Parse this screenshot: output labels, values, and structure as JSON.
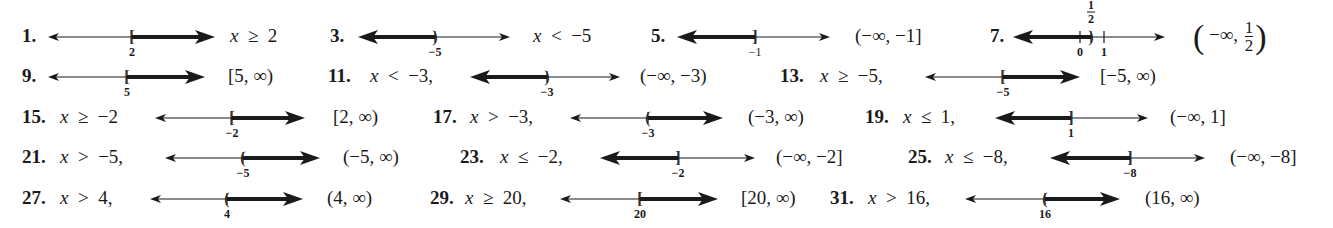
{
  "header": {
    "cutoff_text": ""
  },
  "problems": [
    {
      "id": "1",
      "label": "1.",
      "row": 0,
      "label_x": 22,
      "inequality": "x ≥ 2",
      "ineq_x": 230,
      "interval": "",
      "interval_x": 0,
      "line": {
        "x1": 48,
        "x2": 215,
        "point_x": 132,
        "point_label": "2",
        "bracket": "[",
        "shade": "right",
        "label_bold": true
      }
    },
    {
      "id": "3",
      "label": "3.",
      "row": 0,
      "label_x": 330,
      "inequality": "x < −5",
      "ineq_x": 533,
      "interval": "",
      "interval_x": 0,
      "line": {
        "x1": 358,
        "x2": 510,
        "point_x": 435,
        "point_label": "−5",
        "bracket": ")",
        "shade": "left",
        "label_bold": true
      }
    },
    {
      "id": "5",
      "label": "5.",
      "row": 0,
      "label_x": 651,
      "inequality": "",
      "ineq_x": 0,
      "interval": "(−∞, −1]",
      "interval_x": 855,
      "line": {
        "x1": 677,
        "x2": 830,
        "point_x": 755,
        "point_label": "−1",
        "bracket": "]",
        "shade": "left",
        "label_bold": false
      }
    },
    {
      "id": "7",
      "label": "7.",
      "row": 0,
      "label_x": 990,
      "inequality": "",
      "ineq_x": 0,
      "interval": "(−∞, 1/2)",
      "interval_x": 1193,
      "interval_parts": {
        "open": "(",
        "prefix": "−∞,",
        "num": "1",
        "den": "2",
        "close": ")"
      },
      "line": {
        "x1": 1013,
        "x2": 1165,
        "point_x": 1091,
        "point_label": "1/2",
        "bracket": ")",
        "shade": "left",
        "label_bold": true,
        "extra_ticks": [
          {
            "x": 1080,
            "label": "0"
          },
          {
            "x": 1104,
            "label": "1"
          }
        ]
      }
    },
    {
      "id": "9",
      "label": "9.",
      "row": 1,
      "label_x": 22,
      "inequality": "",
      "ineq_x": 0,
      "interval": "[5, ∞)",
      "interval_x": 228,
      "line": {
        "x1": 48,
        "x2": 205,
        "point_x": 127,
        "point_label": "5",
        "bracket": "[",
        "shade": "right",
        "label_bold": true
      }
    },
    {
      "id": "11",
      "label": "11.",
      "row": 1,
      "label_x": 328,
      "inequality": "x < −3,",
      "ineq_x": 370,
      "interval": "(−∞, −3)",
      "interval_x": 640,
      "line": {
        "x1": 470,
        "x2": 620,
        "point_x": 547,
        "point_label": "−3",
        "bracket": ")",
        "shade": "left",
        "label_bold": true
      }
    },
    {
      "id": "13",
      "label": "13.",
      "row": 1,
      "label_x": 780,
      "inequality": "x ≥ −5,",
      "ineq_x": 820,
      "interval": "[−5, ∞)",
      "interval_x": 1100,
      "line": {
        "x1": 925,
        "x2": 1080,
        "point_x": 1003,
        "point_label": "−5",
        "bracket": "[",
        "shade": "right",
        "label_bold": true
      }
    },
    {
      "id": "15",
      "label": "15.",
      "row": 2,
      "label_x": 22,
      "inequality": "x ≥ −2",
      "ineq_x": 60,
      "interval": "[2, ∞)",
      "interval_x": 333,
      "line": {
        "x1": 155,
        "x2": 305,
        "point_x": 232,
        "point_label": "−2",
        "bracket": "[",
        "shade": "right",
        "label_bold": true
      }
    },
    {
      "id": "17",
      "label": "17.",
      "row": 2,
      "label_x": 433,
      "inequality": "x > −3,",
      "ineq_x": 470,
      "interval": "(−3, ∞)",
      "interval_x": 748,
      "line": {
        "x1": 570,
        "x2": 723,
        "point_x": 648,
        "point_label": "−3",
        "bracket": "(",
        "shade": "right",
        "label_bold": true
      }
    },
    {
      "id": "19",
      "label": "19.",
      "row": 2,
      "label_x": 865,
      "inequality": "x ≤ 1,",
      "ineq_x": 903,
      "interval": "(−∞, 1]",
      "interval_x": 1170,
      "line": {
        "x1": 995,
        "x2": 1148,
        "point_x": 1071,
        "point_label": "1",
        "bracket": "]",
        "shade": "left",
        "label_bold": true
      }
    },
    {
      "id": "21",
      "label": "21.",
      "row": 3,
      "label_x": 22,
      "inequality": "x > −5,",
      "ineq_x": 60,
      "interval": "(−5, ∞)",
      "interval_x": 343,
      "line": {
        "x1": 165,
        "x2": 320,
        "point_x": 243,
        "point_label": "−5",
        "bracket": "(",
        "shade": "right",
        "label_bold": true
      }
    },
    {
      "id": "23",
      "label": "23.",
      "row": 3,
      "label_x": 460,
      "inequality": "x ≤ −2,",
      "ineq_x": 500,
      "interval": "(−∞, −2]",
      "interval_x": 776,
      "line": {
        "x1": 600,
        "x2": 755,
        "point_x": 678,
        "point_label": "−2",
        "bracket": "]",
        "shade": "left",
        "label_bold": true
      }
    },
    {
      "id": "25",
      "label": "25.",
      "row": 3,
      "label_x": 908,
      "inequality": "x ≤ −8,",
      "ineq_x": 945,
      "interval": "(−∞, −8]",
      "interval_x": 1230,
      "line": {
        "x1": 1050,
        "x2": 1205,
        "point_x": 1130,
        "point_label": "−8",
        "bracket": "]",
        "shade": "left",
        "label_bold": true
      }
    },
    {
      "id": "27",
      "label": "27.",
      "row": 4,
      "label_x": 22,
      "inequality": "x > 4,",
      "ineq_x": 60,
      "interval": "(4, ∞)",
      "interval_x": 327,
      "line": {
        "x1": 150,
        "x2": 303,
        "point_x": 227,
        "point_label": "4",
        "bracket": "(",
        "shade": "right",
        "label_bold": true
      }
    },
    {
      "id": "29",
      "label": "29.",
      "row": 4,
      "label_x": 430,
      "inequality": "x ≥ 20,",
      "ineq_x": 465,
      "interval": "[20, ∞)",
      "interval_x": 741,
      "line": {
        "x1": 560,
        "x2": 718,
        "point_x": 640,
        "point_label": "20",
        "bracket": "[",
        "shade": "right",
        "label_bold": true
      }
    },
    {
      "id": "31",
      "label": "31.",
      "row": 4,
      "label_x": 830,
      "inequality": "x > 16,",
      "ineq_x": 868,
      "interval": "(16, ∞)",
      "interval_x": 1145,
      "line": {
        "x1": 965,
        "x2": 1120,
        "point_x": 1045,
        "point_label": "16",
        "bracket": "(",
        "shade": "right",
        "label_bold": true
      }
    }
  ],
  "layout": {
    "row_y": [
      37,
      77,
      118,
      158,
      199
    ]
  },
  "colors": {
    "ink": "#1a1a1a",
    "background": "#ffffff"
  }
}
